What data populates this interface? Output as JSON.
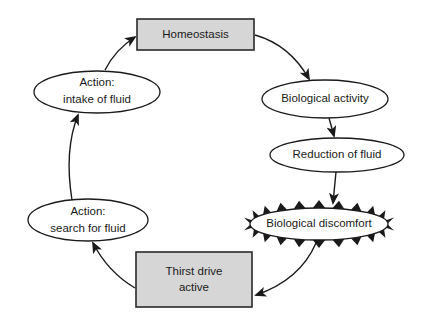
{
  "diagram": {
    "type": "cycle-flowchart",
    "nodes": {
      "homeostasis": {
        "label": "Homeostasis",
        "shape": "rectangle",
        "fill": "#d6d6d6"
      },
      "biological_activity": {
        "label": "Biological activity",
        "shape": "ellipse"
      },
      "reduction_of_fluid": {
        "label": "Reduction of fluid",
        "shape": "ellipse"
      },
      "biological_discomfort": {
        "label": "Biological discomfort",
        "shape": "spiked-ellipse"
      },
      "thirst_drive_active": {
        "line1": "Thirst drive",
        "line2": "active",
        "shape": "rectangle",
        "fill": "#d6d6d6"
      },
      "action_search": {
        "line1": "Action:",
        "line2": "search for fluid",
        "shape": "ellipse"
      },
      "action_intake": {
        "line1": "Action:",
        "line2": "intake of fluid",
        "shape": "ellipse"
      }
    },
    "edges": [
      {
        "from": "Homeostasis",
        "to": "Biological activity"
      },
      {
        "from": "Biological activity",
        "to": "Reduction of fluid"
      },
      {
        "from": "Reduction of fluid",
        "to": "Biological discomfort"
      },
      {
        "from": "Biological discomfort",
        "to": "Thirst drive active"
      },
      {
        "from": "Thirst drive active",
        "to": "Action: search for fluid"
      },
      {
        "from": "Action: search for fluid",
        "to": "Action: intake of fluid"
      },
      {
        "from": "Action: intake of fluid",
        "to": "Homeostasis"
      }
    ],
    "colors": {
      "box_fill": "#d6d6d6",
      "stroke": "#1a1a1a",
      "background": "#ffffff"
    }
  }
}
